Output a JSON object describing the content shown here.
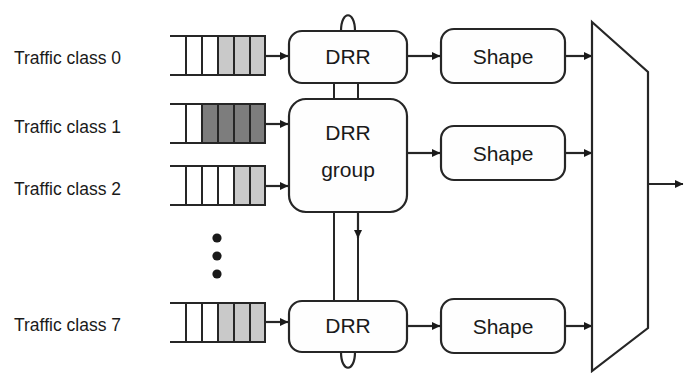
{
  "diagram": {
    "colors": {
      "stroke": "#262626",
      "fill_light": "#c9c9c9",
      "fill_dark": "#7d7d7d",
      "box_fill": "#fefefe",
      "background": "#ffffff"
    },
    "traffic_classes": [
      {
        "label": "Traffic class 0",
        "queue_cells": [
          "empty",
          "empty",
          "light",
          "light",
          "light"
        ],
        "row": 0
      },
      {
        "label": "Traffic class 1",
        "queue_cells": [
          "empty",
          "dark",
          "dark",
          "dark",
          "dark"
        ],
        "row": 1
      },
      {
        "label": "Traffic class 2",
        "queue_cells": [
          "empty",
          "empty",
          "empty",
          "light",
          "light"
        ],
        "row": 2
      },
      {
        "label": "Traffic class 7",
        "queue_cells": [
          "empty",
          "empty",
          "light",
          "light",
          "light"
        ],
        "row": 3
      }
    ],
    "ellipsis": {
      "name": "vertical-ellipsis",
      "dot_count": 3
    },
    "scheduler_boxes": [
      {
        "label": "DRR",
        "position": "top"
      },
      {
        "label": "DRR group",
        "line1": "DRR",
        "line2": "group",
        "position": "middle"
      },
      {
        "label": "DRR",
        "position": "bottom"
      }
    ],
    "shaper_boxes": [
      {
        "label": "Shape",
        "position": "top"
      },
      {
        "label": "Shape",
        "position": "middle"
      },
      {
        "label": "Shape",
        "position": "bottom"
      }
    ],
    "multiplexer": {
      "name": "output-multiplexer",
      "shape": "trapezoid",
      "input_count": 3,
      "output_count": 1
    }
  }
}
